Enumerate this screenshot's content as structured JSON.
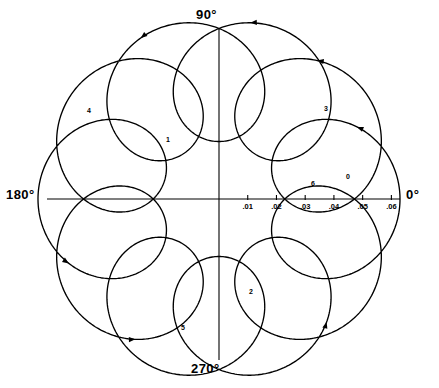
{
  "figure": {
    "title": "",
    "background_color": "#ffffff",
    "line_color": "#000000",
    "width": 439,
    "height": 388
  },
  "axes": {
    "angle_labels": [
      {
        "name": "deg-90",
        "text": "90°"
      },
      {
        "name": "deg-0",
        "text": "0°"
      },
      {
        "name": "deg-180",
        "text": "180°"
      },
      {
        "name": "deg-270",
        "text": "270°"
      }
    ],
    "radial_tick_labels": [
      ".01",
      ".02",
      ".03",
      ".04",
      ".05",
      ".06"
    ],
    "radial_tick_values": [
      0.01,
      0.02,
      0.03,
      0.04,
      0.05,
      0.06
    ],
    "radial_axis_angle_deg": 0,
    "radial_max": 0.063,
    "grid": "off"
  },
  "curve_labels": [
    {
      "text": "0",
      "x": 348,
      "y": 176
    },
    {
      "text": "1",
      "x": 168,
      "y": 139
    },
    {
      "text": "2",
      "x": 251,
      "y": 291
    },
    {
      "text": "3",
      "x": 326,
      "y": 108
    },
    {
      "text": "4",
      "x": 89,
      "y": 110
    },
    {
      "text": "5",
      "x": 183,
      "y": 327
    },
    {
      "text": "6",
      "x": 313,
      "y": 183
    }
  ],
  "chart_data": {
    "type": "line",
    "title": "",
    "subtitle": "",
    "xlabel": "",
    "ylabel": "",
    "coordinate_system": "polar",
    "theta_labels": [
      "0°",
      "90°",
      "180°",
      "270°"
    ],
    "r_tick_labels": [
      ".01",
      ".02",
      ".03",
      ".04",
      ".05",
      ".06"
    ],
    "r_ticks": [
      0.01,
      0.02,
      0.03,
      0.04,
      0.05,
      0.06
    ],
    "rlim": [
      0,
      0.063
    ],
    "legend": "none",
    "legend_position": "none",
    "annotations": [
      "0",
      "1",
      "2",
      "3",
      "4",
      "5",
      "6"
    ],
    "series": [
      {
        "name": "epitrochoid-locus",
        "description": "Looping polar locus: r(t) = |R*exp(i*t) + a*exp(i*k*t)| traced over 0..2pi, with 10 outward loops and arrow direction markers",
        "parametric_form": "z(t) = R*e^{i t} + a*e^{i k t}",
        "R": 0.0415,
        "a": 0.0215,
        "k": 11,
        "t_start_deg": 0,
        "t_end_deg": 360,
        "loop_count": 10,
        "r_outer_max": 0.063,
        "r_inner_min": 0.02
      }
    ]
  },
  "markers": {
    "arrow_count": 7,
    "arrow_style": "solid-triangle"
  }
}
